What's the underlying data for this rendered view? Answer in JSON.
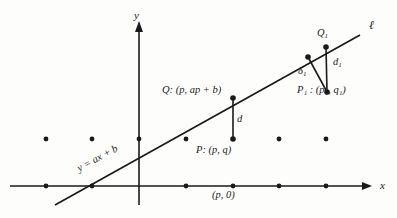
{
  "figure": {
    "background_color": "#fdfdfb",
    "stroke_color": "#1a1a1a"
  },
  "axes": {
    "x_label": "x",
    "y_label": "y",
    "x_axis": {
      "y": 186,
      "x_start": 10,
      "x_end": 372,
      "arrow": true
    },
    "y_axis": {
      "x": 139,
      "y_start": 205,
      "y_end": 22,
      "arrow": true
    }
  },
  "line": {
    "name": "ell",
    "label": "ℓ",
    "equation_label": "y = ax + b",
    "slope_degrees": -28.5,
    "x1": 55,
    "y1": 205,
    "x2": 360,
    "y2": 35
  },
  "points": [
    {
      "id": "Q",
      "label": "Q: (p, ap + b)",
      "x": 233,
      "y": 98,
      "on_line": true
    },
    {
      "id": "P",
      "label": "P: (p, q)",
      "x": 233,
      "y": 139,
      "on_line": false
    },
    {
      "id": "Q1",
      "label": "Q",
      "subscript": "1",
      "x": 326,
      "y": 47,
      "on_line": true
    },
    {
      "id": "P1",
      "label": "P",
      "subscript": "1",
      "x": 327,
      "y": 92,
      "on_line": false
    },
    {
      "id": "F1",
      "label": "",
      "x": 308,
      "y": 57,
      "on_line": true
    }
  ],
  "segments": [
    {
      "id": "d",
      "label": "d",
      "from": "Q",
      "to": "P"
    },
    {
      "id": "d1",
      "label": "d",
      "subscript": "1",
      "from": "Q1",
      "to": "P1"
    },
    {
      "id": "delta1",
      "label": "δ",
      "subscript": "1",
      "from": "F1",
      "to": "P1"
    }
  ],
  "labels": {
    "P1_full": "P₁ : (p₁, q₁)",
    "p_zero": "(p, 0)"
  },
  "lattice_dots": {
    "row_upper_y": 139,
    "row_upper_x": [
      46,
      92,
      139,
      186,
      233,
      279,
      326
    ],
    "row_axis_y": 186,
    "row_axis_x": [
      46,
      92,
      186,
      233,
      279,
      326
    ]
  }
}
